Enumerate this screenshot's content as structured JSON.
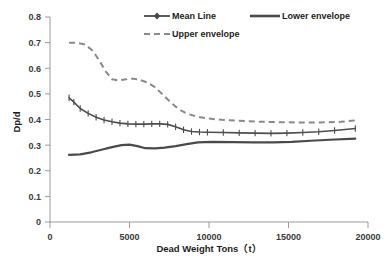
{
  "chart_data": {
    "type": "line",
    "title": "",
    "xlabel": "Dead Weight Tons（t）",
    "ylabel": "Dp/d",
    "xlim": [
      0,
      20000
    ],
    "ylim": [
      0,
      0.8
    ],
    "grid": false,
    "legend_position": "top",
    "xticks": [
      0,
      5000,
      10000,
      15000,
      20000
    ],
    "xtick_labels": [
      "0",
      "5000",
      "10000",
      "15000",
      "20000"
    ],
    "yticks": [
      0,
      0.1,
      0.2,
      0.3,
      0.4,
      0.5,
      0.6,
      0.7,
      0.8
    ],
    "ytick_labels": [
      "0",
      "0.1",
      "0.2",
      "0.3",
      "0.4",
      "0.5",
      "0.6",
      "0.7",
      "0.8"
    ],
    "series": [
      {
        "name": "Mean Line",
        "style": "solid-with-markers",
        "color": "#4d4d4d",
        "x": [
          1200,
          1500,
          1900,
          2400,
          2900,
          3400,
          3900,
          4400,
          4900,
          5400,
          5900,
          6400,
          6900,
          7400,
          7900,
          8400,
          8900,
          9400,
          9900,
          10900,
          11900,
          12900,
          13900,
          14900,
          15900,
          16900,
          17900,
          19200
        ],
        "y": [
          0.485,
          0.468,
          0.443,
          0.424,
          0.409,
          0.398,
          0.391,
          0.386,
          0.383,
          0.382,
          0.382,
          0.383,
          0.383,
          0.381,
          0.372,
          0.36,
          0.353,
          0.351,
          0.35,
          0.349,
          0.348,
          0.347,
          0.346,
          0.347,
          0.349,
          0.352,
          0.357,
          0.365
        ]
      },
      {
        "name": "Lower envelope",
        "style": "solid",
        "color": "#4a4a4a",
        "x": [
          1200,
          1900,
          2600,
          3300,
          3900,
          4500,
          5000,
          5500,
          6000,
          6600,
          7200,
          7900,
          8600,
          9300,
          10200,
          11500,
          12800,
          14000,
          15200,
          16400,
          17600,
          19200
        ],
        "y": [
          0.262,
          0.264,
          0.272,
          0.283,
          0.292,
          0.3,
          0.302,
          0.296,
          0.288,
          0.287,
          0.29,
          0.296,
          0.304,
          0.311,
          0.313,
          0.312,
          0.311,
          0.311,
          0.313,
          0.317,
          0.321,
          0.325
        ]
      },
      {
        "name": "Upper envelope",
        "style": "dashed",
        "color": "#8a8a8a",
        "x": [
          1200,
          1700,
          2200,
          2700,
          3100,
          3500,
          3900,
          4300,
          4700,
          5100,
          5600,
          6100,
          6600,
          7100,
          7600,
          8100,
          8600,
          9200,
          9900,
          10800,
          11800,
          12900,
          14000,
          15100,
          16200,
          17300,
          18300,
          19200
        ],
        "y": [
          0.7,
          0.699,
          0.693,
          0.668,
          0.63,
          0.588,
          0.557,
          0.552,
          0.556,
          0.56,
          0.556,
          0.545,
          0.526,
          0.497,
          0.466,
          0.44,
          0.423,
          0.412,
          0.404,
          0.399,
          0.395,
          0.392,
          0.39,
          0.389,
          0.388,
          0.389,
          0.391,
          0.396
        ]
      }
    ]
  },
  "legend": {
    "items": [
      {
        "label": "Mean Line",
        "marker": "line-with-diamond"
      },
      {
        "label": "Lower envelope",
        "marker": "solid-line"
      },
      {
        "label": "Upper envelope",
        "marker": "dashed-line"
      }
    ]
  }
}
